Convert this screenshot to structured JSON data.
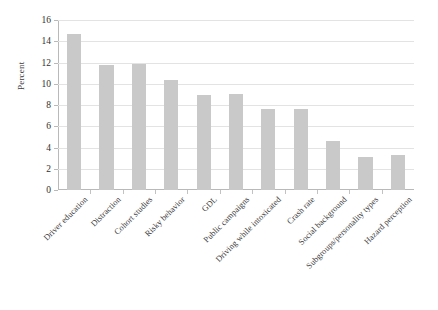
{
  "chart_data": {
    "type": "bar",
    "title": "",
    "subtitle": "",
    "xlabel": "",
    "ylabel": "Percent",
    "ylim": [
      0,
      16
    ],
    "ytick_step": 2,
    "yticks": [
      0,
      2,
      4,
      6,
      8,
      10,
      12,
      14,
      16
    ],
    "grid": true,
    "legend": false,
    "legend_position": "none",
    "orientation": "vertical",
    "bar_color": "#c9c9c9",
    "categories": [
      "Driver education",
      "Distraction",
      "Cohort studies",
      "Risky behavior",
      "GDL",
      "Public campaigns",
      "Driving while intoxicated",
      "Crash rate",
      "Social background",
      "Subgroups/personality types",
      "Hazard perception"
    ],
    "values": [
      14.7,
      11.8,
      11.9,
      10.4,
      8.9,
      9.0,
      7.6,
      7.6,
      4.6,
      3.1,
      3.3
    ]
  },
  "colors": {
    "bar": "#c9c9c9",
    "grid": "#e3e3e3",
    "axis": "#b9b9b9",
    "text": "#3a3a3a",
    "background": "#ffffff"
  }
}
